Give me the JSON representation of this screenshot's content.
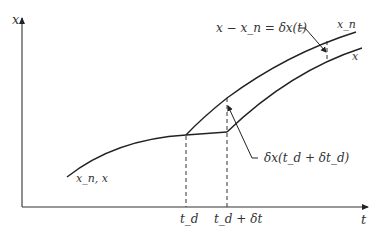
{
  "diagram": {
    "title": "",
    "axes": {
      "y_label": "x",
      "x_label": "t"
    },
    "ticks": {
      "t_d": "t_d",
      "t_d_plus_dt": "t_d + δt"
    },
    "labels": {
      "initial_curve": "x_n, x",
      "upper_curve": "x_n",
      "lower_curve": "x",
      "variation_equation": "x − x_n = δx(t)",
      "jump_variation": "δx(t_d + δt_d)"
    },
    "colors": {
      "line": "#222222",
      "text": "#333333",
      "background": "#ffffff"
    }
  }
}
